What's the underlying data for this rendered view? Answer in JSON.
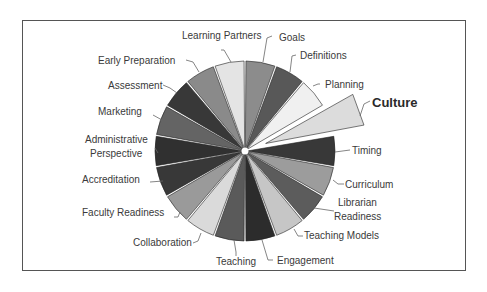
{
  "chart_data": {
    "type": "pie",
    "title": "",
    "start_angle_deg": 0,
    "direction": "clockwise",
    "exploded": [
      "Culture"
    ],
    "highlighted_label": "Culture",
    "categories": [
      "Goals",
      "Definitions",
      "Planning",
      "Culture",
      "Timing",
      "Curriculum",
      "Librarian Readiness",
      "Teaching Models",
      "Engagement",
      "Teaching",
      "Collaboration",
      "Faculty Readiness",
      "Accreditation",
      "Administrative Perspective",
      "Marketing",
      "Assessment",
      "Early Preparation",
      "Learning Partners"
    ],
    "values": [
      1,
      1,
      1,
      1,
      1,
      1,
      1,
      1,
      1,
      1,
      1,
      1,
      1,
      1,
      1,
      1,
      1,
      1
    ],
    "colors": [
      "#8c8c8c",
      "#585858",
      "#f0f0f0",
      "#dcdcdc",
      "#383838",
      "#9c9c9c",
      "#5c5c5c",
      "#c6c6c6",
      "#2c2c2c",
      "#5a5a5a",
      "#dadada",
      "#9a9a9a",
      "#383838",
      "#303030",
      "#646464",
      "#383838",
      "#8a8a8a",
      "#e4e4e4"
    ],
    "legend": "none (leader-line labels)"
  },
  "labels": {
    "goals": "Goals",
    "definitions": "Definitions",
    "planning": "Planning",
    "culture": "Culture",
    "timing": "Timing",
    "curriculum": "Curriculum",
    "librarian_1": "Librarian",
    "librarian_2": "Readiness",
    "teaching_models": "Teaching Models",
    "engagement": "Engagement",
    "teaching": "Teaching",
    "collaboration": "Collaboration",
    "faculty_readiness": "Faculty Readiness",
    "accreditation": "Accreditation",
    "admin_1": "Administrative",
    "admin_2": "Perspective",
    "marketing": "Marketing",
    "assessment": "Assessment",
    "early_preparation": "Early Preparation",
    "learning_partners": "Learning Partners"
  }
}
